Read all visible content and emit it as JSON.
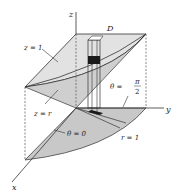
{
  "figure": {
    "type": "3D region diagram in cylindrical coordinates",
    "labels": {
      "z_axis": "z",
      "y_axis": "y",
      "x_axis": "x",
      "region": "D",
      "top_surface": "z = 1",
      "cone_surface": "z = r",
      "theta_quarter_lhs": "θ =",
      "theta_quarter_num": "π",
      "theta_quarter_den": "2",
      "theta_zero": "θ = 0",
      "radius": "r = 1"
    },
    "colors": {
      "surface_fill": "#d9d9d9",
      "base_fill": "#c4c4c4",
      "line": "#333333",
      "volume_element": "#1a1a1a"
    }
  }
}
